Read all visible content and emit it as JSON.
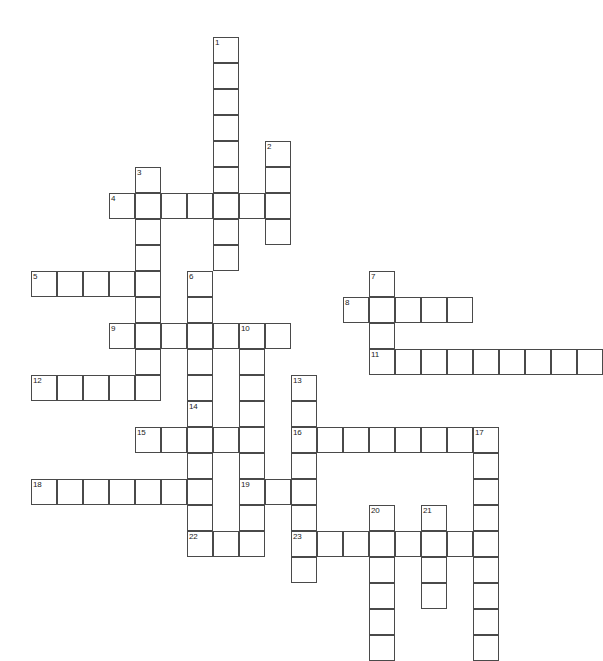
{
  "puzzle": {
    "type": "crossword-grid",
    "title": "Crossword Puzzle Grid",
    "cell_size": 26,
    "origin_x": 31,
    "origin_y": 37,
    "cols": 22,
    "rows": 24,
    "background_color": "#ffffff",
    "cell_fill": "#ffffff",
    "cell_border_color": "#4a4a4a",
    "number_color": "#222222",
    "entries": [
      {
        "number": "1",
        "direction": "down",
        "row": 0,
        "col": 7,
        "length": 9
      },
      {
        "number": "2",
        "direction": "down",
        "row": 4,
        "col": 9,
        "length": 4
      },
      {
        "number": "3",
        "direction": "down",
        "row": 5,
        "col": 4,
        "length": 8
      },
      {
        "number": "4",
        "direction": "across",
        "row": 6,
        "col": 3,
        "length": 7
      },
      {
        "number": "5",
        "direction": "across",
        "row": 9,
        "col": 0,
        "length": 5
      },
      {
        "number": "6",
        "direction": "down",
        "row": 9,
        "col": 6,
        "length": 5
      },
      {
        "number": "7",
        "direction": "down",
        "row": 9,
        "col": 13,
        "length": 4
      },
      {
        "number": "8",
        "direction": "across",
        "row": 10,
        "col": 12,
        "length": 5
      },
      {
        "number": "9",
        "direction": "across",
        "row": 11,
        "col": 3,
        "length": 7
      },
      {
        "number": "10",
        "direction": "down",
        "row": 11,
        "col": 8,
        "length": 8
      },
      {
        "number": "11",
        "direction": "across",
        "row": 12,
        "col": 13,
        "length": 9
      },
      {
        "number": "12",
        "direction": "across",
        "row": 13,
        "col": 0,
        "length": 5
      },
      {
        "number": "13",
        "direction": "down",
        "row": 13,
        "col": 10,
        "length": 7
      },
      {
        "number": "14",
        "direction": "down",
        "row": 14,
        "col": 6,
        "length": 5
      },
      {
        "number": "15",
        "direction": "across",
        "row": 15,
        "col": 4,
        "length": 4
      },
      {
        "number": "16",
        "direction": "across",
        "row": 15,
        "col": 10,
        "length": 8
      },
      {
        "number": "17",
        "direction": "down",
        "row": 15,
        "col": 17,
        "length": 9
      },
      {
        "number": "18",
        "direction": "across",
        "row": 17,
        "col": 0,
        "length": 7
      },
      {
        "number": "19",
        "direction": "across",
        "row": 17,
        "col": 8,
        "length": 3
      },
      {
        "number": "20",
        "direction": "down",
        "row": 18,
        "col": 13,
        "length": 6
      },
      {
        "number": "21",
        "direction": "down",
        "row": 18,
        "col": 15,
        "length": 4
      },
      {
        "number": "22",
        "direction": "across",
        "row": 19,
        "col": 6,
        "length": 3
      },
      {
        "number": "23",
        "direction": "across",
        "row": 19,
        "col": 10,
        "length": 8
      }
    ],
    "extra_cells": [
      {
        "row": 20,
        "col": 10
      },
      {
        "row": 19,
        "col": 8
      }
    ]
  }
}
